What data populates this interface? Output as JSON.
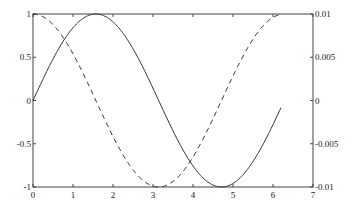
{
  "chart_data": {
    "type": "line",
    "title": "",
    "xlabel": "",
    "ylabel": "",
    "xlim": [
      0,
      7
    ],
    "ylim_left": [
      -1,
      1
    ],
    "ylim_right": [
      -0.01,
      0.01
    ],
    "grid": false,
    "legend": "none",
    "x_ticks": [
      "0",
      "1",
      "2",
      "3",
      "4",
      "5",
      "6",
      "7"
    ],
    "y_left_ticks": [
      "-1",
      "-0.5",
      "0",
      "0.5",
      "1"
    ],
    "y_right_ticks": [
      "-0.01",
      "-0.005",
      "0",
      "0.005",
      "0.01"
    ],
    "series": [
      {
        "name": "sin(x)",
        "axis": "left",
        "style": "solid",
        "x_range": [
          0,
          6.2
        ],
        "function": "sin"
      },
      {
        "name": "0.01*cos(x)",
        "axis": "right",
        "style": "dashed",
        "x_range": [
          0,
          6.2
        ],
        "function": "cos"
      }
    ]
  }
}
